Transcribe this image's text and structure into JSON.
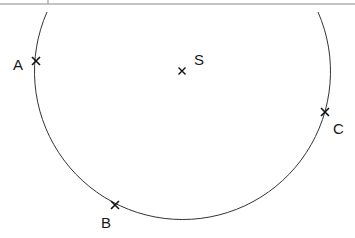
{
  "diagram": {
    "type": "circle-construction",
    "circle": {
      "cx": 183,
      "cy": 74,
      "r": 148,
      "stroke": "#333333"
    },
    "center_point": {
      "label": "S",
      "x": 182,
      "y": 71,
      "label_x": 194,
      "label_y": 65
    },
    "points": [
      {
        "label": "A",
        "x": 36,
        "y": 61,
        "label_x": 13,
        "label_y": 70
      },
      {
        "label": "B",
        "x": 115,
        "y": 205,
        "label_x": 101,
        "label_y": 228
      },
      {
        "label": "C",
        "x": 325,
        "y": 112,
        "label_x": 333,
        "label_y": 134
      }
    ],
    "top_rule": {
      "y": 4,
      "color": "#888888"
    },
    "top_tick": {
      "x": 48,
      "y1": 0,
      "y2": 4
    }
  }
}
